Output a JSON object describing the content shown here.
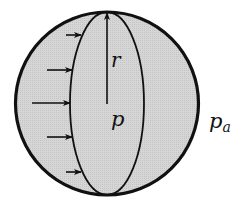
{
  "diagram": {
    "labels": {
      "radius": "r",
      "internal_pressure": "p",
      "ambient_pressure_base": "p",
      "ambient_pressure_sub": "a"
    },
    "colors": {
      "fill": "#d4d4d4",
      "stroke": "#111111",
      "background": "#ffffff"
    },
    "pressure_arrows_count": 5
  }
}
